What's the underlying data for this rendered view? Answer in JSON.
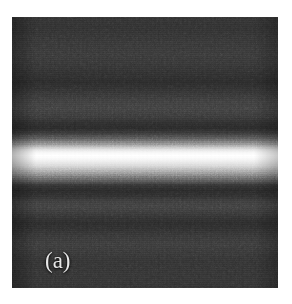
{
  "figure": {
    "panel_label": "(a)",
    "label_color": "#e8e8e8",
    "background_color": "#ffffff",
    "field_color": "#141414",
    "peak_color": "#ffffff",
    "panel_left": 12,
    "panel_top": 17,
    "panel_width": 266,
    "panel_height": 271
  },
  "chart_data": {
    "type": "heatmap",
    "title": "",
    "subtitle": "",
    "xlabel": "",
    "ylabel": "",
    "grid": false,
    "legend": null,
    "colormap": "grayscale",
    "orientation": "horizontal-fringes",
    "xlim": [
      0,
      266
    ],
    "ylim": [
      0,
      271
    ],
    "annotations": [
      {
        "text": "(a)",
        "x": 33,
        "y": 232
      }
    ],
    "axis_profile": "vertical",
    "profile_units": "relative intensity (0-1) vs. vertical position (% of panel height)",
    "profile": [
      {
        "y_pct": 0,
        "intensity": 0.085
      },
      {
        "y_pct": 4,
        "intensity": 0.08
      },
      {
        "y_pct": 9,
        "intensity": 0.095
      },
      {
        "y_pct": 14,
        "intensity": 0.105
      },
      {
        "y_pct": 18,
        "intensity": 0.092
      },
      {
        "y_pct": 22,
        "intensity": 0.072
      },
      {
        "y_pct": 24,
        "intensity": 0.06
      },
      {
        "y_pct": 27,
        "intensity": 0.082
      },
      {
        "y_pct": 31,
        "intensity": 0.118
      },
      {
        "y_pct": 34,
        "intensity": 0.13
      },
      {
        "y_pct": 37,
        "intensity": 0.105
      },
      {
        "y_pct": 39,
        "intensity": 0.07
      },
      {
        "y_pct": 41,
        "intensity": 0.055
      },
      {
        "y_pct": 43,
        "intensity": 0.11
      },
      {
        "y_pct": 45,
        "intensity": 0.24
      },
      {
        "y_pct": 47,
        "intensity": 0.47
      },
      {
        "y_pct": 48,
        "intensity": 0.68
      },
      {
        "y_pct": 49,
        "intensity": 0.86
      },
      {
        "y_pct": 50,
        "intensity": 0.96
      },
      {
        "y_pct": 51,
        "intensity": 1.0
      },
      {
        "y_pct": 52,
        "intensity": 0.985
      },
      {
        "y_pct": 53,
        "intensity": 0.93
      },
      {
        "y_pct": 55,
        "intensity": 0.79
      },
      {
        "y_pct": 57,
        "intensity": 0.56
      },
      {
        "y_pct": 59,
        "intensity": 0.33
      },
      {
        "y_pct": 61,
        "intensity": 0.17
      },
      {
        "y_pct": 62,
        "intensity": 0.09
      },
      {
        "y_pct": 64,
        "intensity": 0.055
      },
      {
        "y_pct": 66,
        "intensity": 0.075
      },
      {
        "y_pct": 68,
        "intensity": 0.115
      },
      {
        "y_pct": 70,
        "intensity": 0.128
      },
      {
        "y_pct": 72,
        "intensity": 0.11
      },
      {
        "y_pct": 74,
        "intensity": 0.082
      },
      {
        "y_pct": 76,
        "intensity": 0.062
      },
      {
        "y_pct": 78,
        "intensity": 0.075
      },
      {
        "y_pct": 81,
        "intensity": 0.1
      },
      {
        "y_pct": 84,
        "intensity": 0.112
      },
      {
        "y_pct": 87,
        "intensity": 0.098
      },
      {
        "y_pct": 90,
        "intensity": 0.085
      },
      {
        "y_pct": 94,
        "intensity": 0.09
      },
      {
        "y_pct": 97,
        "intensity": 0.088
      },
      {
        "y_pct": 100,
        "intensity": 0.082
      }
    ],
    "features": {
      "central_maximum_y_pct": 51,
      "minima_y_pct": [
        24,
        41,
        64,
        76
      ],
      "secondary_maxima_y_pct": [
        14,
        34,
        70,
        84
      ],
      "noise": "strong grain / speckle",
      "background_level": 0.09,
      "peak_level": 1.0
    }
  }
}
